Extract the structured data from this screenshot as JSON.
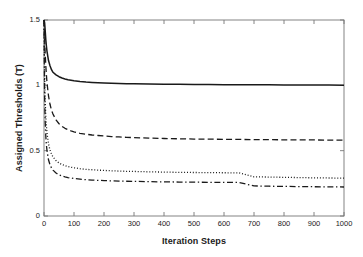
{
  "chart_data": {
    "type": "line",
    "title": "",
    "xlabel": "Iteration Steps",
    "ylabel": "Assigned Thresholds (T)",
    "xlim": [
      0,
      1000
    ],
    "ylim": [
      0,
      1.5
    ],
    "xticks": [
      0,
      100,
      200,
      300,
      400,
      500,
      600,
      700,
      800,
      900,
      1000
    ],
    "xtick_labels": [
      "0",
      "100",
      "200",
      "300",
      "400",
      "500",
      "600",
      "700",
      "800",
      "900",
      "1000"
    ],
    "yticks": [
      0,
      0.5,
      1,
      1.5
    ],
    "ytick_labels": [
      "0",
      "0.5",
      "1",
      "1.5"
    ],
    "grid": false,
    "legend": null,
    "legend_position": "none",
    "x": [
      0,
      2,
      4,
      6,
      8,
      10,
      15,
      20,
      25,
      30,
      40,
      50,
      60,
      70,
      80,
      90,
      100,
      120,
      140,
      160,
      180,
      200,
      225,
      250,
      275,
      300,
      350,
      400,
      450,
      500,
      550,
      600,
      650,
      700,
      750,
      800,
      850,
      900,
      950,
      1000
    ],
    "series": [
      {
        "name": "curve-1",
        "style": "solid",
        "color": "#1a1a1a",
        "plateau": 1.0,
        "values": [
          1.5,
          1.48,
          1.42,
          1.35,
          1.3,
          1.26,
          1.19,
          1.15,
          1.12,
          1.1,
          1.08,
          1.066,
          1.056,
          1.049,
          1.043,
          1.039,
          1.035,
          1.029,
          1.025,
          1.022,
          1.02,
          1.018,
          1.016,
          1.014,
          1.013,
          1.012,
          1.01,
          1.009,
          1.008,
          1.007,
          1.006,
          1.005,
          1.005,
          1.004,
          1.004,
          1.003,
          1.003,
          1.002,
          1.002,
          1.0
        ]
      },
      {
        "name": "curve-2",
        "style": "dashed",
        "color": "#1a1a1a",
        "plateau": 0.58,
        "values": [
          1.5,
          1.36,
          1.24,
          1.15,
          1.08,
          1.02,
          0.92,
          0.855,
          0.81,
          0.78,
          0.735,
          0.706,
          0.686,
          0.671,
          0.66,
          0.651,
          0.644,
          0.633,
          0.626,
          0.62,
          0.616,
          0.612,
          0.608,
          0.605,
          0.602,
          0.6,
          0.596,
          0.593,
          0.591,
          0.589,
          0.588,
          0.587,
          0.586,
          0.585,
          0.584,
          0.583,
          0.583,
          0.582,
          0.581,
          0.58
        ]
      },
      {
        "name": "curve-3",
        "style": "dotted",
        "color": "#1a1a1a",
        "plateau": 0.29,
        "values": [
          1.5,
          1.08,
          0.88,
          0.76,
          0.69,
          0.635,
          0.552,
          0.505,
          0.474,
          0.452,
          0.424,
          0.406,
          0.394,
          0.385,
          0.378,
          0.373,
          0.369,
          0.362,
          0.357,
          0.354,
          0.351,
          0.349,
          0.346,
          0.344,
          0.342,
          0.341,
          0.338,
          0.336,
          0.334,
          0.333,
          0.332,
          0.331,
          0.33,
          0.3,
          0.298,
          0.296,
          0.294,
          0.292,
          0.291,
          0.29
        ]
      },
      {
        "name": "curve-4",
        "style": "dashdot",
        "color": "#1a1a1a",
        "plateau": 0.22,
        "values": [
          1.5,
          0.92,
          0.72,
          0.61,
          0.545,
          0.5,
          0.43,
          0.392,
          0.368,
          0.351,
          0.329,
          0.315,
          0.306,
          0.299,
          0.294,
          0.29,
          0.287,
          0.282,
          0.278,
          0.275,
          0.273,
          0.271,
          0.269,
          0.267,
          0.266,
          0.265,
          0.263,
          0.261,
          0.26,
          0.259,
          0.258,
          0.257,
          0.2565,
          0.23,
          0.228,
          0.2265,
          0.225,
          0.224,
          0.223,
          0.222
        ]
      }
    ]
  },
  "axis": {
    "spine_color": "#777777",
    "tick_color": "#777777",
    "text_color": "#1a1a1a"
  }
}
